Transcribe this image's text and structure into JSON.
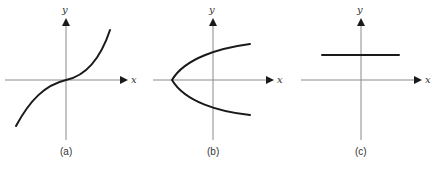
{
  "figure": {
    "panels": [
      {
        "id": "a",
        "caption": "(a)",
        "x_label": "x",
        "y_label": "y",
        "curve": "cubic-like increasing curve through origin"
      },
      {
        "id": "b",
        "caption": "(b)",
        "x_label": "x",
        "y_label": "y",
        "curve": "sideways parabola opening right"
      },
      {
        "id": "c",
        "caption": "(c)",
        "x_label": "x",
        "y_label": "y",
        "curve": "horizontal line above x-axis"
      }
    ]
  },
  "colors": {
    "axis": "#8a8a8a",
    "curve": "#1a1a1a",
    "text": "#333333"
  }
}
